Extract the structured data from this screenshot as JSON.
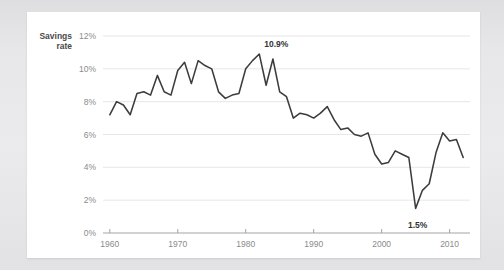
{
  "card": {
    "background_color": "#ffffff",
    "frame_color": "#e9e9eb"
  },
  "chart_data": {
    "type": "line",
    "title": "",
    "series_label": "Savings rate",
    "series_label_line1": "Savings",
    "series_label_line2": "rate",
    "xlabel": "",
    "ylabel": "Savings rate",
    "xlim": [
      1959,
      2013
    ],
    "ylim": [
      0,
      12
    ],
    "grid": true,
    "legend_position": "none",
    "line_color": "#3c3c3c",
    "gridline_color": "#e4e4e4",
    "axis_color": "#9a9a9a",
    "tick_label_color": "#8b8b8b",
    "y_ticks": [
      0,
      2,
      4,
      6,
      8,
      10,
      12
    ],
    "y_tick_labels": [
      "0%",
      "2%",
      "4%",
      "6%",
      "8%",
      "10%",
      "12%"
    ],
    "x_ticks": [
      1960,
      1970,
      1980,
      1990,
      2000,
      2010
    ],
    "x_tick_labels": [
      "1960",
      "1970",
      "1980",
      "1990",
      "2000",
      "2010"
    ],
    "annotations": [
      {
        "label": "10.9%",
        "x": 1982,
        "y": 10.9,
        "dx": 17,
        "dy": -7
      },
      {
        "label": "1.5%",
        "x": 2005,
        "y": 1.5,
        "dx": 2,
        "dy": 20
      }
    ],
    "x": [
      1960,
      1961,
      1962,
      1963,
      1964,
      1965,
      1966,
      1967,
      1968,
      1969,
      1970,
      1971,
      1972,
      1973,
      1974,
      1975,
      1976,
      1977,
      1978,
      1979,
      1980,
      1981,
      1982,
      1983,
      1984,
      1985,
      1986,
      1987,
      1988,
      1989,
      1990,
      1991,
      1992,
      1993,
      1994,
      1995,
      1996,
      1997,
      1998,
      1999,
      2000,
      2001,
      2002,
      2003,
      2004,
      2005,
      2006,
      2007,
      2008,
      2009,
      2010,
      2011,
      2012
    ],
    "values": [
      7.2,
      8.0,
      7.8,
      7.2,
      8.5,
      8.6,
      8.4,
      9.6,
      8.6,
      8.4,
      9.9,
      10.4,
      9.1,
      10.5,
      10.2,
      10.0,
      8.6,
      8.2,
      8.4,
      8.5,
      10.0,
      10.5,
      10.9,
      9.0,
      10.6,
      8.6,
      8.3,
      7.0,
      7.3,
      7.2,
      7.0,
      7.3,
      7.7,
      6.9,
      6.3,
      6.4,
      6.0,
      5.9,
      6.1,
      4.8,
      4.2,
      4.3,
      5.0,
      4.8,
      4.6,
      1.5,
      2.6,
      3.0,
      4.9,
      6.1,
      5.6,
      5.7,
      4.6
    ]
  }
}
